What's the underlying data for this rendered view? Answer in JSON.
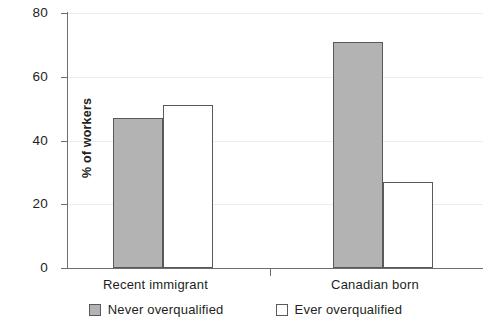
{
  "chart_data": {
    "type": "bar",
    "title": "",
    "xlabel": "",
    "ylabel": "% of workers",
    "categories": [
      "Recent immigrant",
      "Canadian born"
    ],
    "series": [
      {
        "name": "Never overqualified",
        "values": [
          47,
          71
        ],
        "color": "#b3b3b3"
      },
      {
        "name": "Ever overqualified",
        "values": [
          51,
          27
        ],
        "color": "#ffffff"
      }
    ],
    "ylim": [
      0,
      80
    ],
    "yticks": [
      0,
      20,
      40,
      60,
      80
    ],
    "ytick_labels": [
      "0",
      "20",
      "40",
      "60",
      "80"
    ],
    "grid": true,
    "legend_position": "bottom"
  },
  "axis": {
    "y_title": "% of workers",
    "y_ticks": [
      "80",
      "60",
      "40",
      "20",
      "0"
    ],
    "x_categories": [
      "Recent immigrant",
      "Canadian born"
    ]
  },
  "legend": {
    "items": [
      {
        "label": "Never overqualified",
        "swatch": "filled-gray-square"
      },
      {
        "label": "Ever overqualified",
        "swatch": "outline-white-square"
      }
    ]
  },
  "colors": {
    "bar_fill": "#b3b3b3",
    "bar_outline_fill": "#ffffff",
    "bar_border": "#58595b",
    "axis": "#6d6e71",
    "gridline": "#ececed",
    "text": "#231f20",
    "background": "#ffffff"
  }
}
